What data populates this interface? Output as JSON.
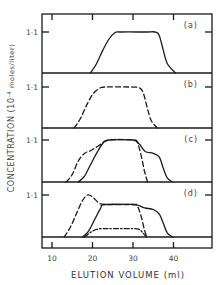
{
  "chart_data": {
    "type": "line",
    "title": "",
    "xlabel": "ELUTION VOLUME (ml)",
    "ylabel_main": "CONCENTRATION (10",
    "ylabel_sup": "-4",
    "ylabel_tail": " moles/liter)",
    "xlim": [
      7.5,
      49.5
    ],
    "x_ticks": [
      10,
      20,
      30,
      40
    ],
    "x_tick_labels": [
      "10",
      "20",
      "30",
      "40"
    ],
    "y_tick_value": 1.1,
    "y_tick_label": "1·1",
    "grid": false,
    "panels": [
      {
        "label": "(a)",
        "series": [
          {
            "name": "solid",
            "style": "solid",
            "x": [
              19.5,
              21,
              22.5,
              24,
              25.5,
              27,
              33,
              35.5,
              36.5,
              37.5,
              38.5,
              40.5
            ],
            "y": [
              0,
              0.25,
              0.6,
              0.9,
              1.08,
              1.1,
              1.1,
              1.1,
              1.0,
              0.6,
              0.25,
              0
            ]
          }
        ]
      },
      {
        "label": "(b)",
        "series": [
          {
            "name": "dashed",
            "style": "dashed",
            "x": [
              15.5,
              17,
              18.5,
              20,
              21.5,
              23,
              29,
              31.5,
              32.5,
              33.5,
              34.5,
              36
            ],
            "y": [
              0,
              0.25,
              0.6,
              0.9,
              1.05,
              1.1,
              1.1,
              1.08,
              0.95,
              0.55,
              0.2,
              0
            ]
          }
        ]
      },
      {
        "label": "(c)",
        "series": [
          {
            "name": "dashed",
            "style": "dashed",
            "x": [
              13.5,
              15,
              16.5,
              18,
              19.5,
              21.5,
              24,
              30,
              31,
              32,
              32.8,
              33.6
            ],
            "y": [
              0,
              0.2,
              0.55,
              0.75,
              0.82,
              0.95,
              1.1,
              1.1,
              1.05,
              0.7,
              0.3,
              0
            ]
          },
          {
            "name": "solid",
            "style": "solid",
            "x": [
              16.5,
              18,
              19.5,
              21,
              22.5,
              24,
              30,
              31.5,
              33,
              35,
              36.5,
              37.5,
              38.5,
              39.8
            ],
            "y": [
              0,
              0.15,
              0.45,
              0.75,
              1.0,
              1.1,
              1.1,
              1.0,
              0.8,
              0.75,
              0.65,
              0.35,
              0.1,
              0
            ]
          }
        ]
      },
      {
        "label": "(d)",
        "series": [
          {
            "name": "dashed",
            "style": "dashed",
            "x": [
              13,
              14.5,
              16,
              17.5,
              18.8,
              20,
              21.5,
              23,
              30,
              31,
              32,
              32.8,
              33.4
            ],
            "y": [
              0,
              0.25,
              0.6,
              0.95,
              1.1,
              1.05,
              0.9,
              0.85,
              0.85,
              0.82,
              0.55,
              0.2,
              0
            ]
          },
          {
            "name": "solid",
            "style": "solid",
            "x": [
              17.5,
              19,
              20.5,
              22,
              23,
              30,
              31.5,
              33,
              35,
              36.5,
              37.5,
              38.5,
              39.8
            ],
            "y": [
              0,
              0.15,
              0.45,
              0.75,
              0.85,
              0.85,
              0.82,
              0.76,
              0.72,
              0.6,
              0.35,
              0.1,
              0
            ]
          },
          {
            "name": "dash-dot",
            "style": "dashdot",
            "x": [
              18,
              19.5,
              21,
              22.5,
              24,
              30,
              31.5,
              32.5,
              33.3
            ],
            "y": [
              0,
              0.12,
              0.2,
              0.22,
              0.22,
              0.22,
              0.2,
              0.1,
              0
            ]
          }
        ]
      }
    ]
  }
}
